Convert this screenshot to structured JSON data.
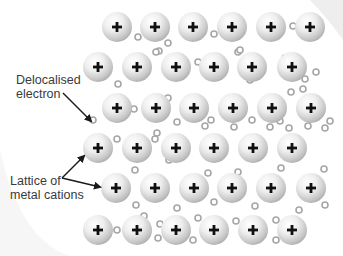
{
  "diagram": {
    "background_arc_color": "#ececec",
    "cation_color_light": "#ffffff",
    "cation_color_dark": "#b8b8b8",
    "plus_color": "#111111",
    "electron_color": "#a6a6a6",
    "cation_radius": 15,
    "electron_radius": 3,
    "cation_symbol": "+",
    "labels": [
      {
        "id": "delocalised-electron",
        "lines": [
          "Delocalised",
          "electron"
        ],
        "x": 16,
        "y": 73
      },
      {
        "id": "lattice-of-metal-cations",
        "lines": [
          "Lattice of",
          "metal cations"
        ],
        "x": 10,
        "y": 174
      }
    ],
    "arrows": [
      {
        "name": "electron-arrow",
        "from": [
          63,
          93
        ],
        "to": [
          91,
          121
        ]
      },
      {
        "name": "cation-arrow-upper",
        "from": [
          62,
          178
        ],
        "to": [
          84,
          156
        ]
      },
      {
        "name": "cation-arrow-lower",
        "from": [
          62,
          178
        ],
        "to": [
          100,
          187
        ]
      }
    ],
    "cations": [
      [
        117,
        27
      ],
      [
        155,
        27
      ],
      [
        193,
        27
      ],
      [
        232,
        27
      ],
      [
        271,
        27
      ],
      [
        310,
        27
      ],
      [
        98,
        67
      ],
      [
        137,
        67
      ],
      [
        176,
        67
      ],
      [
        214,
        67
      ],
      [
        252,
        67
      ],
      [
        292,
        67
      ],
      [
        117,
        108
      ],
      [
        156,
        108
      ],
      [
        194,
        108
      ],
      [
        233,
        108
      ],
      [
        272,
        108
      ],
      [
        311,
        108
      ],
      [
        98,
        148
      ],
      [
        137,
        148
      ],
      [
        176,
        148
      ],
      [
        214,
        148
      ],
      [
        253,
        148
      ],
      [
        292,
        148
      ],
      [
        116,
        188
      ],
      [
        155,
        188
      ],
      [
        194,
        188
      ],
      [
        232,
        188
      ],
      [
        271,
        188
      ],
      [
        311,
        188
      ],
      [
        98,
        230
      ],
      [
        137,
        230
      ],
      [
        176,
        230
      ],
      [
        214,
        230
      ],
      [
        253,
        230
      ],
      [
        292,
        230
      ]
    ],
    "electrons": [
      [
        138,
        37
      ],
      [
        168,
        43
      ],
      [
        214,
        34
      ],
      [
        238,
        52
      ],
      [
        293,
        26
      ],
      [
        159,
        51
      ],
      [
        118,
        84
      ],
      [
        156,
        52
      ],
      [
        198,
        62
      ],
      [
        240,
        50
      ],
      [
        250,
        80
      ],
      [
        285,
        58
      ],
      [
        305,
        79
      ],
      [
        316,
        72
      ],
      [
        93,
        120
      ],
      [
        134,
        109
      ],
      [
        168,
        98
      ],
      [
        177,
        122
      ],
      [
        211,
        120
      ],
      [
        252,
        120
      ],
      [
        280,
        121
      ],
      [
        303,
        89
      ],
      [
        330,
        121
      ],
      [
        291,
        92
      ],
      [
        117,
        139
      ],
      [
        157,
        133
      ],
      [
        205,
        126
      ],
      [
        234,
        127
      ],
      [
        270,
        127
      ],
      [
        289,
        128
      ],
      [
        325,
        128
      ],
      [
        135,
        170
      ],
      [
        155,
        139
      ],
      [
        169,
        160
      ],
      [
        208,
        173
      ],
      [
        238,
        172
      ],
      [
        281,
        168
      ],
      [
        324,
        169
      ],
      [
        308,
        126
      ],
      [
        136,
        205
      ],
      [
        144,
        216
      ],
      [
        177,
        208
      ],
      [
        214,
        202
      ],
      [
        255,
        206
      ],
      [
        299,
        210
      ],
      [
        325,
        205
      ],
      [
        117,
        230
      ],
      [
        160,
        224
      ],
      [
        158,
        238
      ],
      [
        193,
        240
      ],
      [
        198,
        218
      ],
      [
        236,
        221
      ],
      [
        276,
        220
      ],
      [
        276,
        240
      ],
      [
        296,
        226
      ]
    ]
  }
}
